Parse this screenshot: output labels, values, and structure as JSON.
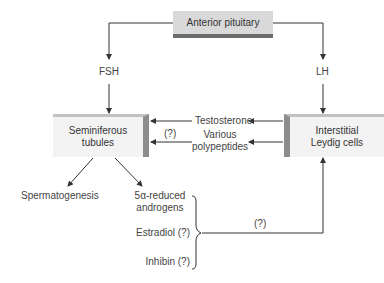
{
  "diagram": {
    "nodes": {
      "anterior_pituitary": "Anterior pituitary",
      "seminiferous_tubules_line1": "Seminiferous",
      "seminiferous_tubules_line2": "tubules",
      "leydig_line1": "Interstitial",
      "leydig_line2": "Leydig cells"
    },
    "hormones": {
      "fsh": "FSH",
      "lh": "LH",
      "testosterone": "Testosterone",
      "polypeptides_line1": "Various",
      "polypeptides_line2": "polypeptides",
      "polypeptides_uncertain": "(?)"
    },
    "outputs": {
      "spermatogenesis": "Spermatogenesis",
      "androgens_line1": "5α-reduced",
      "androgens_line2": "androgens",
      "estradiol": "Estradiol (?)",
      "inhibin": "Inhibin (?)",
      "feedback_uncertain": "(?)"
    },
    "colors": {
      "line": "#333333",
      "top_box": "#d9d9d9",
      "cell_box": "#f3f3f3",
      "shadow": "#8c8c8c"
    }
  }
}
